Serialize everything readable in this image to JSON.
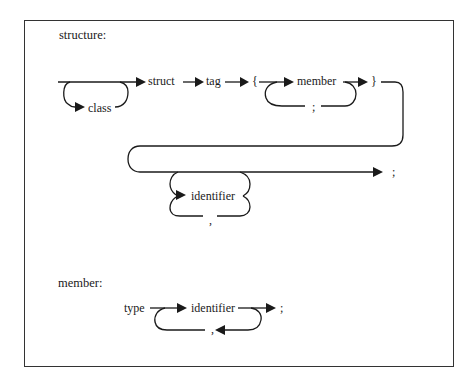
{
  "diagram": {
    "type": "syntax-railroad-diagram",
    "sections": [
      {
        "title": "structure:",
        "nodes": {
          "optional": "class",
          "keyword": "struct",
          "tag": "tag",
          "open_brace": "{",
          "member": "member",
          "member_separator": ";",
          "close_brace": "}",
          "declarator": "identifier",
          "declarator_separator": ",",
          "terminator": ";"
        }
      },
      {
        "title": "member:",
        "nodes": {
          "type": "type",
          "declarator": "identifier",
          "separator": ",",
          "terminator": ";"
        }
      }
    ]
  }
}
